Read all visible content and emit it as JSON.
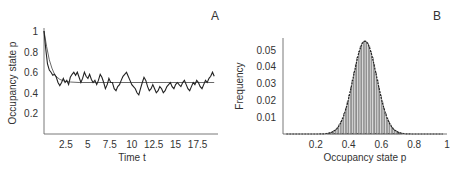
{
  "chart_data": [
    {
      "panel": "A",
      "type": "line",
      "title": "",
      "panel_label": "A",
      "xlabel": "Time t",
      "ylabel": "Occupancy state p",
      "xlim": [
        0,
        19.6
      ],
      "ylim": [
        0,
        1
      ],
      "xticks": [
        "2.5",
        "5",
        "7.5",
        "10",
        "12.5",
        "15",
        "17.5"
      ],
      "xtick_values": [
        2.5,
        5,
        7.5,
        10,
        12.5,
        15,
        17.5
      ],
      "yticks": [
        "0.2",
        "0.4",
        "0.6",
        "0.8",
        "1"
      ],
      "ytick_values": [
        0.2,
        0.4,
        0.6,
        0.8,
        1.0
      ],
      "grid": false,
      "series": [
        {
          "name": "stochastic trajectory",
          "x": [
            0,
            0.2,
            0.4,
            0.6,
            0.8,
            1.0,
            1.2,
            1.4,
            1.6,
            1.8,
            2.0,
            2.2,
            2.4,
            2.6,
            2.8,
            3.0,
            3.2,
            3.4,
            3.6,
            3.8,
            4.0,
            4.2,
            4.4,
            4.6,
            4.8,
            5.0,
            5.2,
            5.4,
            5.6,
            5.8,
            6.0,
            6.2,
            6.4,
            6.6,
            6.8,
            7.0,
            7.2,
            7.4,
            7.6,
            7.8,
            8.0,
            8.2,
            8.4,
            8.6,
            8.8,
            9.0,
            9.2,
            9.4,
            9.6,
            9.8,
            10.0,
            10.2,
            10.4,
            10.6,
            10.8,
            11.0,
            11.2,
            11.4,
            11.6,
            11.8,
            12.0,
            12.2,
            12.4,
            12.6,
            12.8,
            13.0,
            13.2,
            13.4,
            13.6,
            13.8,
            14.0,
            14.2,
            14.4,
            14.6,
            14.8,
            15.0,
            15.2,
            15.4,
            15.6,
            15.8,
            16.0,
            16.2,
            16.4,
            16.6,
            16.8,
            17.0,
            17.2,
            17.4,
            17.6,
            17.8,
            18.0,
            18.2,
            18.4,
            18.6,
            18.8,
            19.0,
            19.2,
            19.4
          ],
          "y": [
            1.0,
            0.82,
            0.68,
            0.62,
            0.6,
            0.57,
            0.58,
            0.55,
            0.5,
            0.47,
            0.5,
            0.54,
            0.5,
            0.52,
            0.48,
            0.55,
            0.58,
            0.6,
            0.57,
            0.6,
            0.55,
            0.5,
            0.54,
            0.6,
            0.56,
            0.54,
            0.58,
            0.53,
            0.5,
            0.52,
            0.48,
            0.52,
            0.58,
            0.55,
            0.5,
            0.44,
            0.48,
            0.54,
            0.5,
            0.5,
            0.44,
            0.42,
            0.46,
            0.48,
            0.52,
            0.56,
            0.58,
            0.6,
            0.56,
            0.52,
            0.48,
            0.46,
            0.44,
            0.4,
            0.38,
            0.44,
            0.5,
            0.55,
            0.52,
            0.46,
            0.42,
            0.44,
            0.48,
            0.44,
            0.4,
            0.42,
            0.46,
            0.44,
            0.4,
            0.42,
            0.46,
            0.48,
            0.5,
            0.46,
            0.44,
            0.48,
            0.5,
            0.48,
            0.46,
            0.5,
            0.52,
            0.48,
            0.44,
            0.42,
            0.46,
            0.5,
            0.48,
            0.52,
            0.5,
            0.46,
            0.44,
            0.48,
            0.52,
            0.5,
            0.54,
            0.56,
            0.6,
            0.56
          ]
        },
        {
          "name": "mean-field",
          "x": [
            0,
            0.3,
            0.6,
            0.9,
            1.2,
            1.5,
            1.8,
            2.1,
            2.5,
            3,
            4,
            6,
            8,
            10,
            12,
            14,
            16,
            18,
            19.4
          ],
          "y": [
            1.0,
            0.85,
            0.72,
            0.64,
            0.58,
            0.55,
            0.53,
            0.52,
            0.51,
            0.505,
            0.5,
            0.5,
            0.5,
            0.5,
            0.5,
            0.5,
            0.5,
            0.5,
            0.5
          ]
        }
      ]
    },
    {
      "panel": "B",
      "type": "bar",
      "title": "",
      "panel_label": "B",
      "xlabel": "Occupancy state p",
      "ylabel": "Frequency",
      "xlim": [
        0,
        1
      ],
      "ylim": [
        0,
        0.058
      ],
      "xticks": [
        "0.2",
        "0.4",
        "0.6",
        "0.8",
        "1"
      ],
      "xtick_values": [
        0.2,
        0.4,
        0.6,
        0.8,
        1.0
      ],
      "yticks": [
        "0.01",
        "0.02",
        "0.03",
        "0.04",
        "0.05"
      ],
      "ytick_values": [
        0.01,
        0.02,
        0.03,
        0.04,
        0.05
      ],
      "grid": false,
      "histogram": {
        "bin_width": 0.01,
        "distribution": "approximately normal",
        "mean": 0.5,
        "std": 0.072,
        "peak_frequency": 0.055
      },
      "overlay_curve": {
        "name": "fitted density",
        "mean": 0.5,
        "std": 0.072,
        "peak": 0.055
      }
    }
  ]
}
